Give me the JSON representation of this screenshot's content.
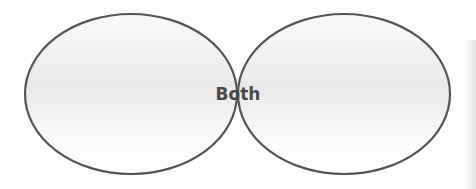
{
  "diagram": {
    "type": "venn",
    "sets": [
      {
        "name": "left-set",
        "label": ""
      },
      {
        "name": "right-set",
        "label": ""
      }
    ],
    "intersection_label": "Both",
    "colors": {
      "stroke": "#555555",
      "fill_light": "#ffffff",
      "fill_shade": "#d8d8d8",
      "text": "#4a4a4a"
    }
  }
}
